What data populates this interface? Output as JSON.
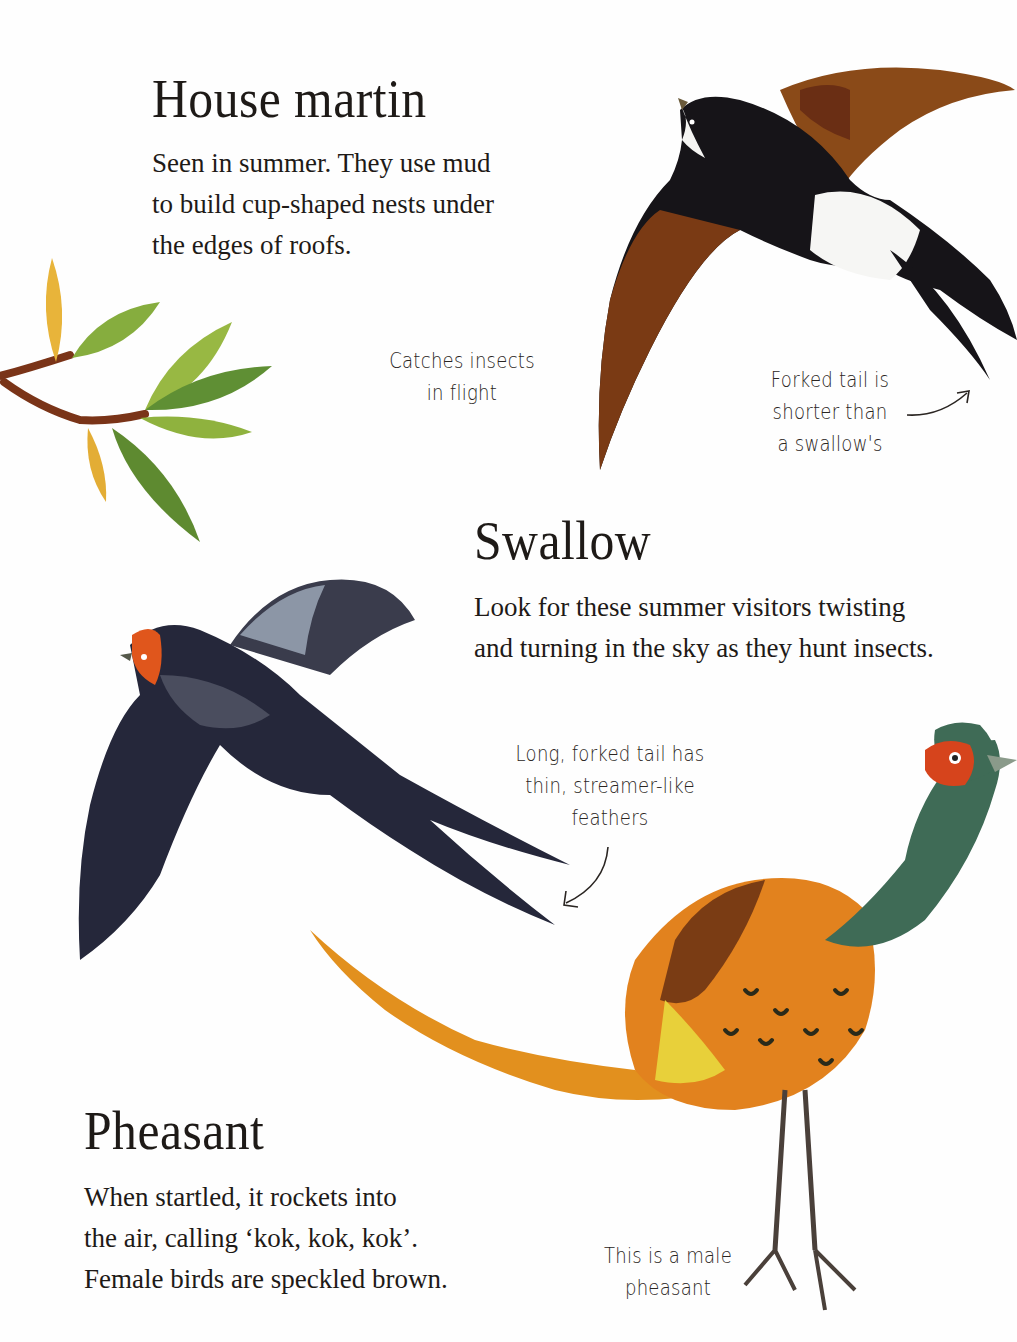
{
  "house_martin": {
    "title": "House martin",
    "body": [
      "Seen in summer. They use mud",
      "to build cup-shaped nests under",
      "the edges of roofs."
    ],
    "note_insects": [
      "Catches insects",
      "in flight"
    ],
    "note_tail": [
      "Forked tail is",
      "shorter than",
      "a swallow's"
    ]
  },
  "swallow": {
    "title": "Swallow",
    "body": [
      "Look for these summer visitors twisting",
      "and turning in the sky as they hunt insects."
    ],
    "note_tail": [
      "Long, forked tail has",
      "thin, streamer-like",
      "feathers"
    ]
  },
  "pheasant": {
    "title": "Pheasant",
    "body": [
      "When startled, it rockets into",
      "the air, calling ‘kok, kok, kok’.",
      "Female birds are speckled brown."
    ],
    "note_male": [
      "This is a male",
      "pheasant"
    ]
  },
  "colors": {
    "background": "#fefefe",
    "text": "#1e1a17",
    "martin_brown": "#7a3a14",
    "martin_black": "#161418",
    "swallow_blue": "#2b2d3c",
    "swallow_throat": "#e0561c",
    "pheasant_orange": "#e2821e",
    "pheasant_green": "#3f6b56",
    "pheasant_face": "#d6441c",
    "leaf_green": "#7fa83a",
    "leaf_yellow": "#e8b43a",
    "twig": "#7a3418"
  }
}
